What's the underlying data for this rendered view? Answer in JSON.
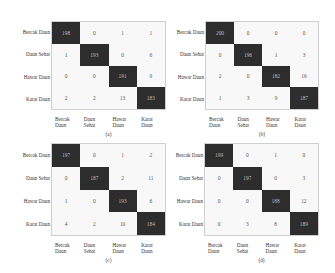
{
  "labels": {
    "rows": [
      "Bercak Daun",
      "Daun Sehat",
      "Hawar Daun",
      "Karat Daun"
    ],
    "cols": [
      [
        "Bercak",
        "Daun"
      ],
      [
        "Daun",
        "Sehat"
      ],
      [
        "Hawar",
        "Daun"
      ],
      [
        "Karat",
        "Daun"
      ]
    ]
  },
  "panels": [
    {
      "caption": "(a)",
      "matrix": [
        [
          198,
          0,
          1,
          1
        ],
        [
          1,
          193,
          0,
          6
        ],
        [
          0,
          0,
          191,
          9
        ],
        [
          2,
          2,
          13,
          183
        ]
      ]
    },
    {
      "caption": "(b)",
      "matrix": [
        [
          200,
          0,
          0,
          0
        ],
        [
          0,
          196,
          1,
          3
        ],
        [
          2,
          0,
          182,
          16
        ],
        [
          1,
          3,
          9,
          187
        ]
      ]
    },
    {
      "caption": "(c)",
      "matrix": [
        [
          197,
          0,
          1,
          2
        ],
        [
          0,
          187,
          2,
          11
        ],
        [
          1,
          0,
          193,
          6
        ],
        [
          4,
          2,
          10,
          184
        ]
      ]
    },
    {
      "caption": "(d)",
      "matrix": [
        [
          199,
          0,
          1,
          0
        ],
        [
          0,
          197,
          0,
          3
        ],
        [
          0,
          0,
          188,
          12
        ],
        [
          0,
          3,
          8,
          189
        ]
      ]
    }
  ],
  "colors": {
    "diagonal": "#2d2d2d",
    "offdiagonal": "#f8f8f8",
    "diag_text": "#bdbdbd",
    "cell_text": "#555555"
  },
  "chart_data": [
    {
      "type": "heatmap",
      "title": "(a)",
      "xlabel": "Predicted",
      "ylabel": "Actual",
      "x": [
        "Bercak Daun",
        "Daun Sehat",
        "Hawar Daun",
        "Karat Daun"
      ],
      "y": [
        "Bercak Daun",
        "Daun Sehat",
        "Hawar Daun",
        "Karat Daun"
      ],
      "values": [
        [
          198,
          0,
          1,
          1
        ],
        [
          1,
          193,
          0,
          6
        ],
        [
          0,
          0,
          191,
          9
        ],
        [
          2,
          2,
          13,
          183
        ]
      ]
    },
    {
      "type": "heatmap",
      "title": "(b)",
      "x": [
        "Bercak Daun",
        "Daun Sehat",
        "Hawar Daun",
        "Karat Daun"
      ],
      "y": [
        "Bercak Daun",
        "Daun Sehat",
        "Hawar Daun",
        "Karat Daun"
      ],
      "values": [
        [
          200,
          0,
          0,
          0
        ],
        [
          0,
          196,
          1,
          3
        ],
        [
          2,
          0,
          182,
          16
        ],
        [
          1,
          3,
          9,
          187
        ]
      ]
    },
    {
      "type": "heatmap",
      "title": "(c)",
      "x": [
        "Bercak Daun",
        "Daun Sehat",
        "Hawar Daun",
        "Karat Daun"
      ],
      "y": [
        "Bercak Daun",
        "Daun Sehat",
        "Hawar Daun",
        "Karat Daun"
      ],
      "values": [
        [
          197,
          0,
          1,
          2
        ],
        [
          0,
          187,
          2,
          11
        ],
        [
          1,
          0,
          193,
          6
        ],
        [
          4,
          2,
          10,
          184
        ]
      ]
    },
    {
      "type": "heatmap",
      "title": "(d)",
      "x": [
        "Bercak Daun",
        "Daun Sehat",
        "Hawar Daun",
        "Karat Daun"
      ],
      "y": [
        "Bercak Daun",
        "Daun Sehat",
        "Hawar Daun",
        "Karat Daun"
      ],
      "values": [
        [
          199,
          0,
          1,
          0
        ],
        [
          0,
          197,
          0,
          3
        ],
        [
          0,
          0,
          188,
          12
        ],
        [
          0,
          3,
          8,
          189
        ]
      ]
    }
  ]
}
